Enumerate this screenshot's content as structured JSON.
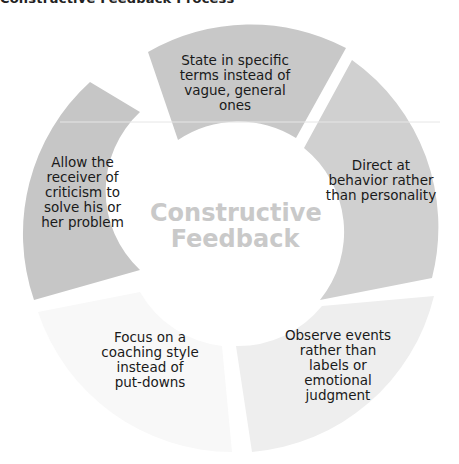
{
  "title": "Constructive Feedback Process",
  "center": {
    "label": "Constructive\nFeedback",
    "color": "#c9c9c9"
  },
  "segments": [
    {
      "id": "state",
      "label": "State in specific\nterms instead of\nvague, general ones",
      "color": "#c8c8c8"
    },
    {
      "id": "direct",
      "label": "Direct at\nbehavior rather\nthan personality",
      "color": "#d0d0d0"
    },
    {
      "id": "observe",
      "label": "Observe events\nrather than\nlabels or\nemotional\njudgment",
      "color": "#eeeeee"
    },
    {
      "id": "focus",
      "label": "Focus on a\ncoaching style\ninstead of\nput-downs",
      "color": "#f8f8f8"
    },
    {
      "id": "allow",
      "label": "Allow the\nreceiver of\ncriticism to\nsolve his or\nher problem",
      "color": "#c6c6c6"
    }
  ]
}
